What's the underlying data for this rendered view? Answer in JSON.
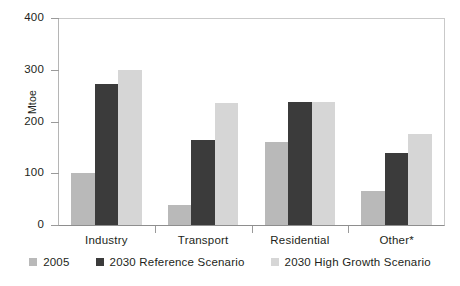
{
  "chart_data": {
    "type": "bar",
    "title": "",
    "subtitle": "",
    "xlabel": "",
    "ylabel": "Mtoe",
    "ylim": [
      0,
      400
    ],
    "yticks": [
      0,
      100,
      200,
      300,
      400
    ],
    "ytick_labels": [
      "0",
      "100",
      "200",
      "300",
      "400"
    ],
    "grid": false,
    "legend_position": "bottom",
    "categories": [
      "Industry",
      "Transport",
      "Residential",
      "Other*"
    ],
    "series": [
      {
        "name": "2005",
        "color": "#b9b9b9",
        "values": [
          100,
          38,
          160,
          65
        ]
      },
      {
        "name": "2030 Reference Scenario",
        "color": "#3b3b3b",
        "values": [
          272,
          165,
          238,
          140
        ]
      },
      {
        "name": "2030 High Growth Scenario",
        "color": "#d6d6d6",
        "values": [
          300,
          236,
          238,
          176
        ]
      }
    ]
  },
  "axis": {
    "y_title": "Mtoe"
  },
  "colors": {
    "series_2005": "#b9b9b9",
    "series_reference": "#3b3b3b",
    "series_high_growth": "#d6d6d6",
    "axis_line": "#8e8e8e",
    "frame_line": "#c9c9c9",
    "text": "#231f20",
    "background": "#ffffff"
  }
}
